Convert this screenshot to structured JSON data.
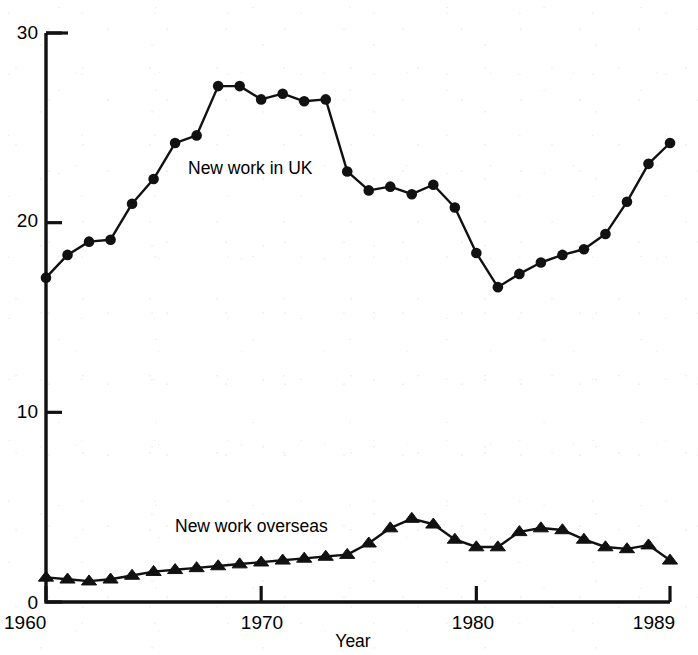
{
  "chart_data": {
    "type": "line",
    "title": "",
    "xlabel": "Year",
    "ylabel": "",
    "xlim": [
      1960,
      1989
    ],
    "ylim": [
      0,
      30
    ],
    "grid": false,
    "legend_position": "inline-annotation",
    "x": [
      1960,
      1961,
      1962,
      1963,
      1964,
      1965,
      1966,
      1967,
      1968,
      1969,
      1970,
      1971,
      1972,
      1973,
      1974,
      1975,
      1976,
      1977,
      1978,
      1979,
      1980,
      1981,
      1982,
      1983,
      1984,
      1985,
      1986,
      1987,
      1988,
      1989
    ],
    "xticks": [
      "1960",
      "1970",
      "1980",
      "1989"
    ],
    "xtick_values": [
      1960,
      1970,
      1980,
      1989
    ],
    "yticks": [
      "0",
      "10",
      "20",
      "30"
    ],
    "ytick_values": [
      0,
      10,
      20,
      30
    ],
    "series": [
      {
        "name": "New work in UK",
        "marker": "filled-circle",
        "annotation": "New work in UK",
        "values": [
          17.1,
          18.3,
          19.0,
          19.1,
          21.0,
          22.3,
          24.2,
          24.6,
          27.2,
          27.2,
          26.5,
          26.8,
          26.4,
          26.5,
          22.7,
          21.7,
          21.9,
          21.5,
          22.0,
          20.8,
          18.4,
          16.6,
          17.3,
          17.9,
          18.3,
          18.6,
          19.4,
          21.1,
          23.1,
          24.2
        ]
      },
      {
        "name": "New work overseas",
        "marker": "filled-triangle",
        "annotation": "New work overseas",
        "values": [
          1.3,
          1.2,
          1.1,
          1.2,
          1.4,
          1.6,
          1.7,
          1.8,
          1.9,
          2.0,
          2.1,
          2.2,
          2.3,
          2.4,
          2.5,
          3.1,
          3.9,
          4.4,
          4.1,
          3.3,
          2.9,
          2.9,
          3.7,
          3.9,
          3.8,
          3.3,
          2.9,
          2.8,
          3.0,
          2.2
        ]
      }
    ]
  },
  "axes": {
    "x_title": "Year",
    "y_tick_labels": [
      "30",
      "20",
      "10",
      "0"
    ],
    "x_tick_labels": [
      "1960",
      "1970",
      "1980",
      "1989"
    ]
  },
  "annotations": {
    "uk_label": "New work in UK",
    "overseas_label": "New work overseas"
  },
  "colors": {
    "ink": "#111111",
    "background": "#ffffff"
  }
}
